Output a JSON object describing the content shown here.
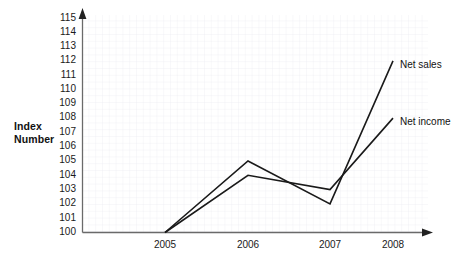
{
  "chart_data": {
    "type": "line",
    "title": "",
    "xlabel": "",
    "ylabel": "Index Number",
    "ylabel_line1": "Index",
    "ylabel_line2": "Number",
    "categories": [
      "2005",
      "2006",
      "2007",
      "2008"
    ],
    "x": [
      2005,
      2006,
      2007,
      2008
    ],
    "ylim": [
      100,
      115
    ],
    "yticks": [
      115,
      114,
      113,
      112,
      111,
      110,
      109,
      108,
      107,
      106,
      105,
      104,
      103,
      102,
      101,
      100
    ],
    "grid": true,
    "legend_position": "right-inline",
    "series": [
      {
        "name": "Net sales",
        "values": [
          100,
          105,
          102,
          112
        ],
        "color": "#1a1a1a",
        "label_at": {
          "x": 2008,
          "y": 112
        }
      },
      {
        "name": "Net income",
        "values": [
          100,
          104,
          103,
          108
        ],
        "color": "#1a1a1a",
        "label_at": {
          "x": 2008,
          "y": 108
        }
      }
    ],
    "annotations": [
      {
        "text": "Net sales",
        "series": "Net sales"
      },
      {
        "text": "Net income",
        "series": "Net income"
      }
    ],
    "colors": {
      "line": "#1a1a1a",
      "axis": "#555555",
      "grid": "#e8e8ee",
      "text": "#1a1a1a",
      "background": "#ffffff"
    }
  }
}
